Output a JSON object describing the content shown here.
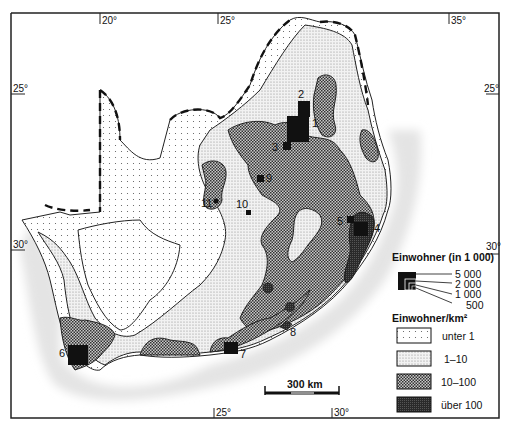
{
  "map": {
    "region": "Südliches Afrika",
    "graticule": {
      "top": [
        "20°",
        "25°",
        "35°"
      ],
      "bottom": [
        "25°",
        "30°"
      ],
      "left": [
        "25°",
        "30°"
      ],
      "right": [
        "25°",
        "30°"
      ]
    },
    "cities": [
      {
        "id": "1",
        "label": "1"
      },
      {
        "id": "2",
        "label": "2"
      },
      {
        "id": "3",
        "label": "3"
      },
      {
        "id": "4",
        "label": "4"
      },
      {
        "id": "5",
        "label": "5"
      },
      {
        "id": "6",
        "label": "6"
      },
      {
        "id": "7",
        "label": "7"
      },
      {
        "id": "8",
        "label": "8"
      },
      {
        "id": "9",
        "label": "9"
      },
      {
        "id": "10",
        "label": "10"
      },
      {
        "id": "11",
        "label": "11"
      }
    ],
    "scale_bar": {
      "label": "300 km"
    }
  },
  "legend": {
    "population_title": "Einwohner (in 1 000)",
    "population_sizes": [
      "5 000",
      "2 000",
      "1 000",
      "500"
    ],
    "density_title": "Einwohner/km²",
    "density_classes": [
      {
        "label": "unter 1",
        "pattern": "sparse-dots"
      },
      {
        "label": "1–10",
        "pattern": "fine-dots"
      },
      {
        "label": "10–100",
        "pattern": "checker"
      },
      {
        "label": "über 100",
        "pattern": "dark"
      }
    ]
  }
}
